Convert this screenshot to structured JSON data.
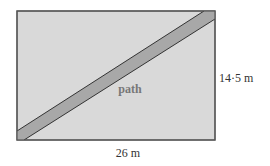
{
  "diagram": {
    "field": {
      "width_label": "26 m",
      "height_label": "14·5 m",
      "width_m": 26,
      "height_m": 14.5
    },
    "path": {
      "label": "path"
    },
    "colors": {
      "field_fill": "#d9d9d9",
      "path_fill": "#a8a8a8",
      "outline": "#444444",
      "label_text": "#333333",
      "path_label_text": "#777777"
    }
  }
}
